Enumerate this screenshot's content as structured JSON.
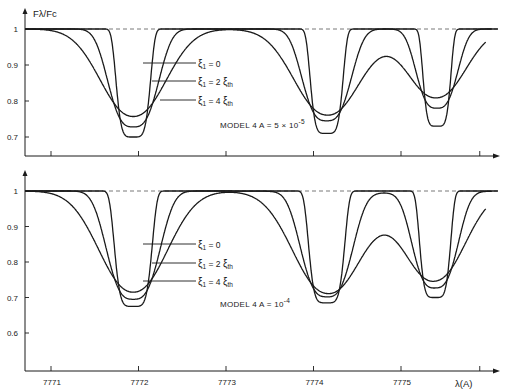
{
  "chart_data": [
    {
      "type": "line",
      "panel": "top",
      "title": "MODEL 4  A = 5 × 10^-5",
      "annotation": {
        "prefix": "MODEL 4  A = 5 × 10",
        "exponent": "-5"
      },
      "ylabel": "Fλ/Fc",
      "xlabel": "",
      "ylim": [
        0.65,
        1.02
      ],
      "yticks": [
        {
          "value": 1,
          "label": "1"
        },
        {
          "value": 0.9,
          "label": "0.9"
        },
        {
          "value": 0.8,
          "label": "0.8"
        },
        {
          "value": 0.7,
          "label": "0.7"
        }
      ],
      "xticks": [
        7771,
        7772,
        7773,
        7774,
        7775,
        7775.9
      ],
      "xlim": [
        7770.7,
        7776.1
      ],
      "continuum_line": {
        "value": 1,
        "style": "dashed"
      },
      "line_centers": [
        7771.94,
        7774.15,
        7775.41
      ],
      "series": [
        {
          "name": "ξ1 = 0",
          "label_main": "ξ",
          "sub": "1",
          "eq": " = 0",
          "suffix": "",
          "suffix_sub": "",
          "minima": [
            0.7,
            0.71,
            0.73
          ],
          "half_widths": [
            0.21,
            0.2,
            0.17
          ],
          "sharpness": 5.0,
          "hump": 1.0
        },
        {
          "name": "ξ1 = 2 ξth",
          "label_main": "ξ",
          "sub": "1",
          "eq": " = 2 ",
          "suffix": "ξ",
          "suffix_sub": "th",
          "minima": [
            0.728,
            0.745,
            0.78
          ],
          "half_widths": [
            0.34,
            0.33,
            0.28
          ],
          "sharpness": 3.0,
          "hump": 1.0
        },
        {
          "name": "ξ1 = 4 ξth",
          "label_main": "ξ",
          "sub": "1",
          "eq": " = 4 ",
          "suffix": "ξ",
          "suffix_sub": "th",
          "minima": [
            0.757,
            0.77,
            0.818
          ],
          "half_widths": [
            0.5,
            0.5,
            0.44
          ],
          "sharpness": 2.2,
          "hump": 0.985
        }
      ]
    },
    {
      "type": "line",
      "panel": "bottom",
      "title": "MODEL 4  A = 10^-4",
      "annotation": {
        "prefix": "MODEL 4  A = 10",
        "exponent": "-4"
      },
      "ylabel": "",
      "xlabel": "λ(A)",
      "ylim": [
        0.55,
        1.02
      ],
      "yticks": [
        {
          "value": 1,
          "label": "1"
        },
        {
          "value": 0.9,
          "label": "0.9"
        },
        {
          "value": 0.8,
          "label": "0.8"
        },
        {
          "value": 0.7,
          "label": "0.7"
        },
        {
          "value": 0.6,
          "label": "0.6"
        }
      ],
      "xticks": [
        7771,
        7772,
        7773,
        7774,
        7775,
        7775.9
      ],
      "xtick_labels": [
        "7771",
        "7772",
        "7773",
        "7774",
        "7775"
      ],
      "xlim": [
        7770.7,
        7776.1
      ],
      "continuum_line": {
        "value": 1,
        "style": "dashed"
      },
      "line_centers": [
        7771.94,
        7774.15,
        7775.39
      ],
      "series": [
        {
          "name": "ξ1 = 0",
          "label_main": "ξ",
          "sub": "1",
          "eq": " = 0",
          "suffix": "",
          "suffix_sub": "",
          "minima": [
            0.675,
            0.685,
            0.7
          ],
          "half_widths": [
            0.23,
            0.22,
            0.19
          ],
          "sharpness": 5.0,
          "hump": 1.0
        },
        {
          "name": "ξ1 = 2 ξth",
          "label_main": "ξ",
          "sub": "1",
          "eq": " = 2 ",
          "suffix": "ξ",
          "suffix_sub": "th",
          "minima": [
            0.695,
            0.705,
            0.73
          ],
          "half_widths": [
            0.36,
            0.35,
            0.31
          ],
          "sharpness": 3.0,
          "hump": 0.995
        },
        {
          "name": "ξ1 = 4 ξth",
          "label_main": "ξ",
          "sub": "1",
          "eq": " = 4 ",
          "suffix": "ξ",
          "suffix_sub": "th",
          "minima": [
            0.715,
            0.73,
            0.765
          ],
          "half_widths": [
            0.52,
            0.52,
            0.46
          ],
          "sharpness": 2.2,
          "hump": 0.97
        }
      ]
    }
  ],
  "layout": {
    "panels": [
      {
        "x0": 25,
        "yTop": 8,
        "yAxis": 156,
        "yOne": 29,
        "yPerUnit": 360,
        "legendY": [
          63,
          81,
          100
        ],
        "legendX0": [
          143,
          152,
          160
        ],
        "legendTextX": 198,
        "modelX": 220,
        "modelY": 128,
        "ylabelX": 33,
        "ylabelY": 17
      },
      {
        "x0": 25,
        "yTop": 170,
        "yAxis": 371,
        "yOne": 191,
        "yPerUnit": 355,
        "legendY": [
          244,
          263,
          281
        ],
        "legendX0": [
          143,
          152,
          143
        ],
        "legendTextX": 198,
        "modelX": 220,
        "modelY": 307
      }
    ],
    "xOrigin": 7771,
    "xPxAtOrigin": 51,
    "pxPerAngstrom": 87.5,
    "xEnd": 500
  }
}
